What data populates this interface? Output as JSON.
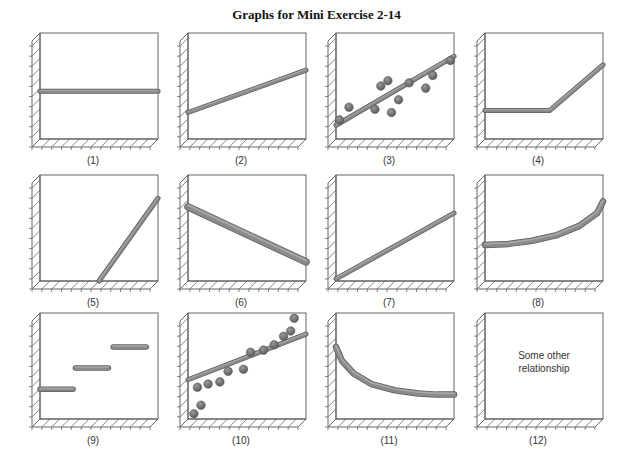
{
  "title": "Graphs for Mini Exercise 2-14",
  "chart_data": [
    {
      "id": 1,
      "caption": "(1)",
      "type": "line",
      "description": "horizontal line (constant)",
      "x": [
        0,
        1
      ],
      "y": [
        0.45,
        0.45
      ]
    },
    {
      "id": 2,
      "caption": "(2)",
      "type": "line",
      "description": "upward sloping line with positive intercept",
      "x": [
        0,
        1
      ],
      "y": [
        0.25,
        0.65
      ]
    },
    {
      "id": 3,
      "caption": "(3)",
      "type": "scatter",
      "description": "scatter points with upward trend line",
      "x": [
        0.03,
        0.11,
        0.33,
        0.38,
        0.44,
        0.47,
        0.53,
        0.62,
        0.76,
        0.82,
        0.97
      ],
      "y": [
        0.18,
        0.3,
        0.28,
        0.5,
        0.55,
        0.25,
        0.37,
        0.53,
        0.48,
        0.6,
        0.74
      ],
      "trend": {
        "x": [
          0,
          1
        ],
        "y": [
          0.13,
          0.78
        ]
      }
    },
    {
      "id": 4,
      "caption": "(4)",
      "type": "line",
      "description": "flat then upward sloping (piecewise)",
      "x": [
        0,
        0.55,
        1
      ],
      "y": [
        0.27,
        0.27,
        0.7
      ]
    },
    {
      "id": 5,
      "caption": "(5)",
      "type": "line",
      "description": "line starting at zero midway along x then rising steeply",
      "x": [
        0.5,
        1
      ],
      "y": [
        0,
        0.78
      ]
    },
    {
      "id": 6,
      "caption": "(6)",
      "type": "line",
      "description": "downward sloping line",
      "x": [
        0,
        1
      ],
      "y": [
        0.7,
        0.18
      ]
    },
    {
      "id": 7,
      "caption": "(7)",
      "type": "line",
      "description": "upward sloping line through origin",
      "x": [
        0,
        1
      ],
      "y": [
        0.02,
        0.64
      ]
    },
    {
      "id": 8,
      "caption": "(8)",
      "type": "line",
      "description": "increasing convex curve",
      "x": [
        0,
        0.2,
        0.4,
        0.6,
        0.8,
        0.95,
        1
      ],
      "y": [
        0.34,
        0.35,
        0.38,
        0.43,
        0.52,
        0.64,
        0.75
      ]
    },
    {
      "id": 9,
      "caption": "(9)",
      "type": "step",
      "description": "three horizontal step segments",
      "segments": [
        {
          "x": [
            0,
            0.28
          ],
          "y": [
            0.28,
            0.28
          ]
        },
        {
          "x": [
            0.3,
            0.58
          ],
          "y": [
            0.48,
            0.48
          ]
        },
        {
          "x": [
            0.62,
            0.9
          ],
          "y": [
            0.68,
            0.68
          ]
        }
      ]
    },
    {
      "id": 10,
      "caption": "(10)",
      "type": "scatter",
      "description": "curved scatter points with linear trend line",
      "x": [
        0.05,
        0.08,
        0.11,
        0.17,
        0.27,
        0.34,
        0.47,
        0.53,
        0.64,
        0.73,
        0.81,
        0.87,
        0.9
      ],
      "y": [
        0.05,
        0.3,
        0.13,
        0.33,
        0.35,
        0.45,
        0.47,
        0.63,
        0.65,
        0.7,
        0.78,
        0.83,
        0.95
      ],
      "trend": {
        "x": [
          0,
          1
        ],
        "y": [
          0.37,
          0.8
        ]
      }
    },
    {
      "id": 11,
      "caption": "(11)",
      "type": "line",
      "description": "decreasing convex curve leveling off",
      "x": [
        0,
        0.05,
        0.15,
        0.3,
        0.5,
        0.7,
        0.85,
        1
      ],
      "y": [
        0.68,
        0.55,
        0.43,
        0.33,
        0.27,
        0.24,
        0.23,
        0.23
      ]
    },
    {
      "id": 12,
      "caption": "(12)",
      "type": "none",
      "description": "text only",
      "note_lines": [
        "Some other",
        "relationship"
      ]
    }
  ]
}
